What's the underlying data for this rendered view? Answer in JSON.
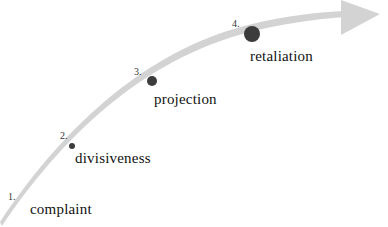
{
  "diagram": {
    "colors": {
      "arrow": "#d3d3d3",
      "dot": "#3c3c3c",
      "text": "#111111"
    },
    "stages": [
      {
        "number": "1.",
        "label": "complaint"
      },
      {
        "number": "2.",
        "label": "divisiveness"
      },
      {
        "number": "3.",
        "label": "projection"
      },
      {
        "number": "4.",
        "label": "retaliation"
      }
    ]
  }
}
